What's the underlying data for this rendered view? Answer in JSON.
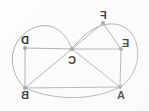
{
  "diagram": {
    "style": {
      "background_color": "#fdfdfd",
      "edge_color": "#a8a8a8",
      "vertex_color": "#9a9a9a",
      "label_color": "#1d1d1d",
      "labels_mirrored": true
    },
    "vertices": [
      {
        "id": "A",
        "label": "A",
        "x": 120,
        "y": 87,
        "label_x": 117,
        "label_y": 90
      },
      {
        "id": "B",
        "label": "B",
        "x": 25,
        "y": 88,
        "label_x": 21,
        "label_y": 90
      },
      {
        "id": "C",
        "label": "C",
        "x": 72,
        "y": 49,
        "label_x": 68,
        "label_y": 55
      },
      {
        "id": "D",
        "label": "D",
        "x": 25,
        "y": 48,
        "label_x": 21,
        "label_y": 35
      },
      {
        "id": "E",
        "label": "E",
        "x": 121,
        "y": 49,
        "label_x": 122,
        "label_y": 38
      },
      {
        "id": "F",
        "label": "F",
        "x": 103,
        "y": 23,
        "label_x": 100,
        "label_y": 10
      }
    ],
    "edges_straight": [
      {
        "from": "D",
        "to": "C"
      },
      {
        "from": "D",
        "to": "B"
      },
      {
        "from": "B",
        "to": "C"
      },
      {
        "from": "B",
        "to": "A"
      },
      {
        "from": "C",
        "to": "A"
      },
      {
        "from": "C",
        "to": "E"
      },
      {
        "from": "C",
        "to": "F"
      },
      {
        "from": "F",
        "to": "E"
      },
      {
        "from": "E",
        "to": "A"
      }
    ],
    "edges_curved": [
      {
        "from": "B",
        "to": "C",
        "path": "M 25 88 C 2 66, 12 32, 40 26 C 58 23, 68 38, 72 49",
        "bulge": "left-outward"
      },
      {
        "from": "C",
        "to": "A",
        "path": "M 72 49 C 88 26, 116 14, 132 34 C 143 50, 138 76, 120 87",
        "bulge": "right-outward"
      },
      {
        "from": "B",
        "to": "A",
        "path": "M 25 88 C 55 101, 92 101, 120 87",
        "bulge": "bottom-outward"
      }
    ],
    "counts": {
      "vertices": 6,
      "straight_edges": 9,
      "curved_edges": 3
    }
  }
}
